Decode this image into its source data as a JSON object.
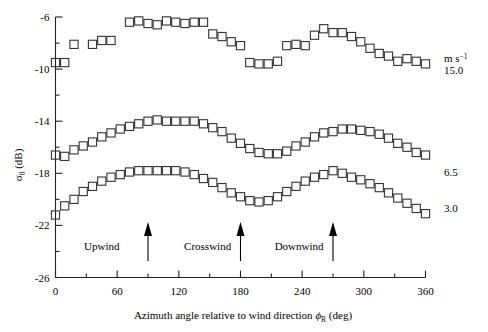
{
  "chart_data": {
    "type": "scatter",
    "title": "",
    "xlabel": "Azimuth angle relative to wind direction ϕR (deg)",
    "ylabel": "σ0 (dB)",
    "xlim": [
      0,
      360
    ],
    "ylim": [
      -26,
      -6
    ],
    "grid": false,
    "marker": "open-square",
    "xticks": [
      0,
      60,
      120,
      180,
      240,
      300,
      360
    ],
    "xtick_labels": [
      "0",
      "60",
      "120",
      "180",
      "240",
      "300",
      "360"
    ],
    "xminor_step": 30,
    "yticks": [
      -6,
      -10,
      -14,
      -18,
      -22,
      -26
    ],
    "ytick_labels": [
      "-6",
      "-10",
      "-14",
      "-18",
      "-22",
      "-26"
    ],
    "yminor_step": 2,
    "legend_position": "right",
    "legend_units": "m s⁻¹",
    "series": [
      {
        "name": "15.0",
        "label": "15.0",
        "x": [
          0,
          9,
          18,
          36,
          45,
          54,
          72,
          81,
          90,
          99,
          108,
          117,
          126,
          135,
          144,
          153,
          162,
          171,
          180,
          189,
          198,
          207,
          216,
          225,
          234,
          243,
          252,
          261,
          270,
          279,
          288,
          297,
          306,
          315,
          324,
          333,
          342,
          351,
          360
        ],
        "y": [
          -9.5,
          -9.5,
          -8.1,
          -8.1,
          -7.8,
          -7.8,
          -6.4,
          -6.3,
          -6.5,
          -6.6,
          -6.3,
          -6.4,
          -6.5,
          -6.4,
          -6.4,
          -7.3,
          -7.5,
          -7.9,
          -8.2,
          -9.5,
          -9.6,
          -9.6,
          -9.4,
          -8.2,
          -8.1,
          -8.2,
          -7.4,
          -6.9,
          -7.2,
          -7.2,
          -7.5,
          -7.9,
          -8.4,
          -8.8,
          -9.0,
          -9.4,
          -9.2,
          -9.4,
          -9.6
        ]
      },
      {
        "name": "6.5",
        "label": "6.5",
        "x": [
          0,
          9,
          18,
          27,
          36,
          45,
          54,
          63,
          72,
          81,
          90,
          99,
          108,
          117,
          126,
          135,
          144,
          153,
          162,
          171,
          180,
          189,
          198,
          207,
          216,
          225,
          234,
          243,
          252,
          261,
          270,
          279,
          288,
          297,
          306,
          315,
          324,
          333,
          342,
          351,
          360
        ],
        "y": [
          -16.6,
          -16.7,
          -16.2,
          -15.9,
          -15.6,
          -15.2,
          -14.9,
          -14.6,
          -14.4,
          -14.2,
          -14.0,
          -13.9,
          -14.0,
          -14.0,
          -14.0,
          -14.0,
          -14.2,
          -14.5,
          -14.8,
          -15.3,
          -15.7,
          -16.1,
          -16.4,
          -16.5,
          -16.5,
          -16.3,
          -15.9,
          -15.6,
          -15.2,
          -14.9,
          -14.8,
          -14.6,
          -14.6,
          -14.7,
          -14.8,
          -15.0,
          -15.3,
          -15.7,
          -16.0,
          -16.4,
          -16.6
        ]
      },
      {
        "name": "3.0",
        "label": "3.0",
        "x": [
          0,
          9,
          18,
          27,
          36,
          45,
          54,
          63,
          72,
          81,
          90,
          99,
          108,
          117,
          126,
          135,
          144,
          153,
          162,
          171,
          180,
          189,
          198,
          207,
          216,
          225,
          234,
          243,
          252,
          261,
          270,
          279,
          288,
          297,
          306,
          315,
          324,
          333,
          342,
          351,
          360
        ],
        "y": [
          -21.2,
          -20.5,
          -20.0,
          -19.4,
          -19.0,
          -18.6,
          -18.3,
          -18.1,
          -17.9,
          -17.8,
          -17.8,
          -17.8,
          -17.8,
          -17.8,
          -17.9,
          -18.1,
          -18.4,
          -18.7,
          -19.1,
          -19.5,
          -19.8,
          -20.1,
          -20.2,
          -20.1,
          -19.8,
          -19.4,
          -19.0,
          -18.6,
          -18.3,
          -18.1,
          -17.8,
          -18.0,
          -18.3,
          -18.5,
          -18.8,
          -19.1,
          -19.5,
          -19.9,
          -20.3,
          -20.7,
          -21.1
        ]
      }
    ],
    "annotations": [
      {
        "label": "Upwind",
        "x": 45,
        "arrow_x": 90
      },
      {
        "label": "Crosswind",
        "x": 148,
        "arrow_x": 180
      },
      {
        "label": "Downwind",
        "x": 237,
        "arrow_x": 270
      }
    ]
  },
  "axis": {
    "y_label_sigma": "σ",
    "y_label_sub": "0",
    "y_label_rest": " (dB)",
    "x_label_main": "Azimuth angle relative to wind direction ",
    "x_label_phi": "ϕ",
    "x_label_phi_sub": "R",
    "x_label_tail": " (deg)"
  },
  "legend": {
    "units_m": "m s",
    "units_exp": "−1",
    "entries": [
      "15.0",
      "6.5",
      "3.0"
    ]
  }
}
